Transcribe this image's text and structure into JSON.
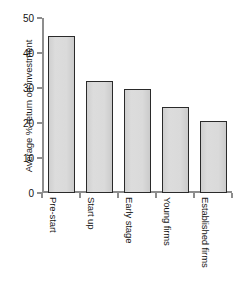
{
  "chart_data": {
    "type": "bar",
    "title": "",
    "subtitle": "",
    "xlabel": "",
    "ylabel": "Average % return on investment",
    "categories": [
      "Pre-start",
      "Start up",
      "Early stage",
      "Young firms",
      "Established firms"
    ],
    "values": [
      45.0,
      32.0,
      29.8,
      24.7,
      20.6
    ],
    "ylim": [
      0,
      50
    ],
    "ytick_labels": [
      "0",
      "10",
      "20",
      "30",
      "40",
      "50"
    ],
    "ytick_values": [
      0,
      10,
      20,
      30,
      40,
      50
    ],
    "grid": false,
    "legend": null,
    "legend_position": "none",
    "bar_fill_color": "#d9d9d9",
    "bar_edge_color": "#2a2a2a",
    "axis_color": "#8d8d8d",
    "text_color": "#141414",
    "background_color": "#ffffff",
    "xtick_style": "between-bars",
    "category_label_rotation": 90,
    "ylabel_rotation": -90
  }
}
